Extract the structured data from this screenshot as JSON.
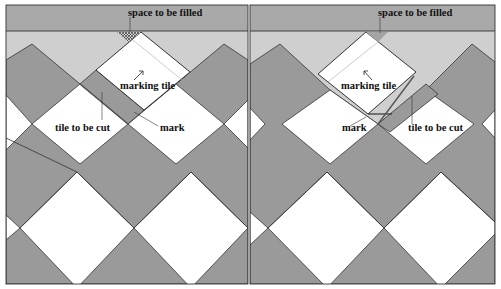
{
  "colors": {
    "wall_band": "#a9a9a9",
    "gap_band": "#cfcfcf",
    "dark_tile": "#9a9a9a",
    "light_tile": "#ffffff",
    "outline": "#333333",
    "text": "#111111"
  },
  "panels": [
    {
      "id": "left",
      "labels": {
        "space": "space to be filled",
        "marking_tile": "marking tile",
        "tile_to_be_cut": "tile to be cut",
        "mark": "mark"
      }
    },
    {
      "id": "right",
      "labels": {
        "space": "space to be filled",
        "marking_tile": "marking tile",
        "tile_to_be_cut": "tile to be cut",
        "mark": "mark"
      }
    }
  ]
}
